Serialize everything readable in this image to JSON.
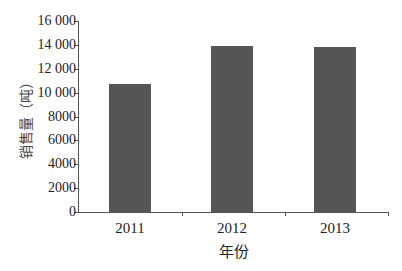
{
  "chart_data": {
    "type": "bar",
    "title": "",
    "xlabel": "年份",
    "ylabel": "销售量（吨）",
    "categories": [
      "2011",
      "2012",
      "2013"
    ],
    "values": [
      10700,
      13900,
      13800
    ],
    "ylim": [
      0,
      16000
    ],
    "yticks": [
      0,
      2000,
      4000,
      6000,
      8000,
      10000,
      12000,
      14000,
      16000
    ],
    "ytick_labels": [
      "0",
      "2000",
      "4000",
      "6000",
      "8000",
      "10 000",
      "12 000",
      "14 000",
      "16 000"
    ],
    "grid": false,
    "legend": null,
    "bar_color": "#555555"
  }
}
